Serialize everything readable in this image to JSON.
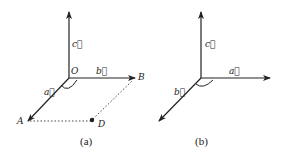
{
  "diagrams": [
    {
      "caption": "(a)",
      "origin_label": "O",
      "vectors": {
        "a": "a⃗",
        "b": "b⃗",
        "c": "c⃗"
      },
      "points": {
        "A": "A",
        "B": "B",
        "D": "D"
      }
    },
    {
      "caption": "(b)",
      "vectors": {
        "a": "a⃗",
        "b": "b⃗",
        "c": "c⃗"
      }
    }
  ],
  "colors": {
    "stroke": "#222222",
    "background": "#ffffff"
  }
}
